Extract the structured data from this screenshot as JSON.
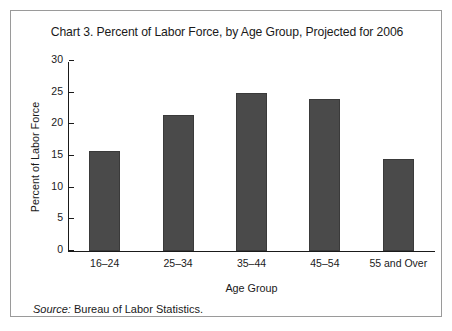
{
  "figure": {
    "title": "Chart 3. Percent of Labor Force, by Age Group, Projected for 2006",
    "source_label": "Source:",
    "source_text": "Bureau of Labor Statistics.",
    "border_color": "#9a9a9a",
    "background_color": "#ffffff"
  },
  "chart_data": {
    "type": "bar",
    "title": "Chart 3. Percent of Labor Force, by Age Group, Projected for 2006",
    "xlabel": "Age Group",
    "ylabel": "Percent of Labor Force",
    "categories": [
      "16–24",
      "25–34",
      "35–44",
      "45–54",
      "55 and Over"
    ],
    "values": [
      15.8,
      21.4,
      25.0,
      24.0,
      14.5
    ],
    "ylim": [
      0,
      30
    ],
    "yticks": [
      0,
      5,
      10,
      15,
      20,
      25,
      30
    ],
    "ytick_labels": [
      "0",
      "5",
      "10",
      "15",
      "20",
      "25",
      "30"
    ],
    "grid": false,
    "legend": null,
    "bar_color": "#4a4a4a",
    "axis_color": "#1a1a1a"
  }
}
